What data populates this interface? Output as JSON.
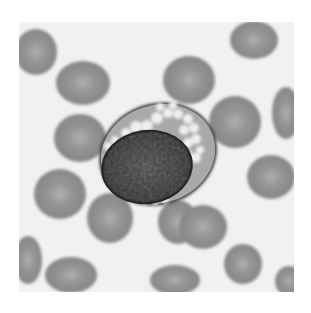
{
  "image": {
    "subject": "blood smear micrograph",
    "description": "Grayscale micrograph of a large cell with dark nucleus and clear cytoplasmic vacuoles surrounded by red blood cells",
    "field": {
      "x": 19,
      "y": 22,
      "width": 275,
      "height": 270,
      "background": "#f1f1f1"
    },
    "colors": {
      "background": "#f1f1f1",
      "rbc": "#8e8e8e",
      "rbc_center": "#b4b4b4",
      "cytoplasm": "#a9a9a9",
      "nucleus": "#3a3a3a",
      "nucleus_dark": "#1e1e1e",
      "vacuole": "#efefef"
    },
    "red_cells": [
      {
        "cx": 36,
        "cy": 52,
        "rx": 21,
        "ry": 23
      },
      {
        "cx": 83,
        "cy": 83,
        "rx": 27,
        "ry": 22
      },
      {
        "cx": 189,
        "cy": 80,
        "rx": 26,
        "ry": 24
      },
      {
        "cx": 254,
        "cy": 40,
        "rx": 24,
        "ry": 19
      },
      {
        "cx": 286,
        "cy": 113,
        "rx": 14,
        "ry": 26
      },
      {
        "cx": 235,
        "cy": 122,
        "rx": 26,
        "ry": 26
      },
      {
        "cx": 80,
        "cy": 138,
        "rx": 26,
        "ry": 24
      },
      {
        "cx": 271,
        "cy": 177,
        "rx": 24,
        "ry": 22
      },
      {
        "cx": 60,
        "cy": 194,
        "rx": 26,
        "ry": 25
      },
      {
        "cx": 110,
        "cy": 218,
        "rx": 23,
        "ry": 25
      },
      {
        "cx": 178,
        "cy": 222,
        "rx": 20,
        "ry": 22
      },
      {
        "cx": 203,
        "cy": 227,
        "rx": 24,
        "ry": 22
      },
      {
        "cx": 28,
        "cy": 260,
        "rx": 14,
        "ry": 24
      },
      {
        "cx": 71,
        "cy": 275,
        "rx": 26,
        "ry": 18
      },
      {
        "cx": 175,
        "cy": 280,
        "rx": 25,
        "ry": 15
      },
      {
        "cx": 243,
        "cy": 264,
        "rx": 19,
        "ry": 20
      },
      {
        "cx": 289,
        "cy": 281,
        "rx": 14,
        "ry": 15
      }
    ],
    "main_cell": {
      "outline": {
        "cx": 158,
        "cy": 154,
        "rx": 58,
        "ry": 49,
        "rotate": -18
      },
      "nucleus": {
        "cx": 147,
        "cy": 167,
        "rx": 46,
        "ry": 37,
        "rotate": -8
      },
      "vacuoles": [
        {
          "cx": 136,
          "cy": 127,
          "r": 6
        },
        {
          "cx": 147,
          "cy": 126,
          "r": 6
        },
        {
          "cx": 126,
          "cy": 133,
          "r": 5
        },
        {
          "cx": 157,
          "cy": 118,
          "r": 6
        },
        {
          "cx": 168,
          "cy": 113,
          "r": 5
        },
        {
          "cx": 178,
          "cy": 114,
          "r": 5
        },
        {
          "cx": 188,
          "cy": 119,
          "r": 5
        },
        {
          "cx": 194,
          "cy": 128,
          "r": 5
        },
        {
          "cx": 184,
          "cy": 130,
          "r": 5
        },
        {
          "cx": 196,
          "cy": 139,
          "r": 5
        },
        {
          "cx": 188,
          "cy": 143,
          "r": 5
        },
        {
          "cx": 200,
          "cy": 150,
          "r": 4
        },
        {
          "cx": 196,
          "cy": 158,
          "r": 5
        },
        {
          "cx": 189,
          "cy": 155,
          "r": 4
        },
        {
          "cx": 115,
          "cy": 140,
          "r": 4
        },
        {
          "cx": 108,
          "cy": 146,
          "r": 4
        },
        {
          "cx": 160,
          "cy": 107,
          "r": 4
        },
        {
          "cx": 173,
          "cy": 105,
          "r": 4
        },
        {
          "cx": 135,
          "cy": 199,
          "r": 4
        },
        {
          "cx": 145,
          "cy": 201,
          "r": 4
        },
        {
          "cx": 155,
          "cy": 201,
          "r": 4
        },
        {
          "cx": 165,
          "cy": 199,
          "r": 4
        }
      ]
    }
  }
}
